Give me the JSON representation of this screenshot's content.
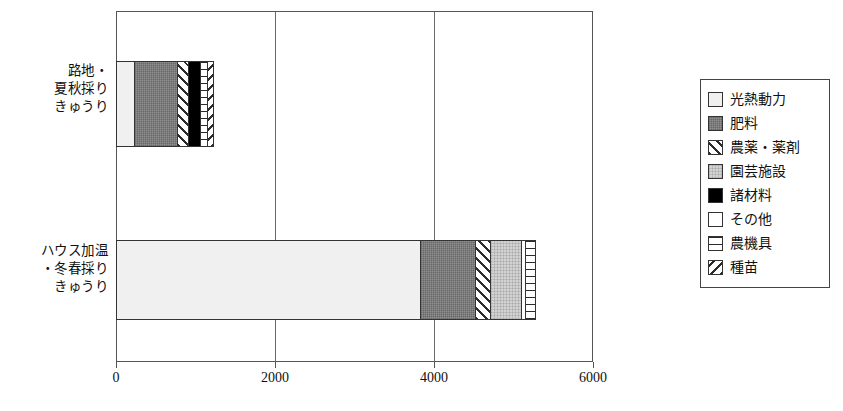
{
  "chart_data": {
    "type": "bar",
    "orientation": "horizontal",
    "stacked": true,
    "title": "",
    "xlabel": "",
    "ylabel": "",
    "xlim": [
      0,
      6000
    ],
    "xticks": [
      "0",
      "2000",
      "4000",
      "6000"
    ],
    "grid": true,
    "legend_position": "right",
    "categories": [
      "路地・\n夏秋採り\nきゅうり",
      "ハウス加温\n・冬春採り\nきゅうり"
    ],
    "series": [
      {
        "name": "光熱動力",
        "values": [
          225,
          3830
        ]
      },
      {
        "name": "肥料",
        "values": [
          540,
          690
        ]
      },
      {
        "name": "農薬・薬剤",
        "values": [
          140,
          190
        ]
      },
      {
        "name": "園芸施設",
        "values": [
          0,
          380
        ]
      },
      {
        "name": "諸材料",
        "values": [
          150,
          0
        ]
      },
      {
        "name": "その他",
        "values": [
          0,
          60
        ]
      },
      {
        "name": "農機具",
        "values": [
          90,
          115
        ]
      },
      {
        "name": "種苗",
        "values": [
          75,
          0
        ]
      }
    ],
    "totals": [
      1220,
      5265
    ]
  },
  "legend": {
    "items": [
      {
        "label": "光熱動力",
        "pattern": "p-konetsu"
      },
      {
        "label": "肥料",
        "pattern": "p-hiryo"
      },
      {
        "label": "農薬・薬剤",
        "pattern": "p-nouyaku"
      },
      {
        "label": "園芸施設",
        "pattern": "p-engei"
      },
      {
        "label": "諸材料",
        "pattern": "p-shozairyo"
      },
      {
        "label": "その他",
        "pattern": "p-sonota"
      },
      {
        "label": "農機具",
        "pattern": "p-noukigu"
      },
      {
        "label": "種苗",
        "pattern": "p-shubyo"
      }
    ]
  },
  "axis": {
    "ticks": [
      {
        "label": "0",
        "value": 0
      },
      {
        "label": "2000",
        "value": 2000
      },
      {
        "label": "4000",
        "value": 4000
      },
      {
        "label": "6000",
        "value": 6000
      }
    ]
  },
  "colors": {
    "frame": "#555555",
    "gridline": "#6a6a6a",
    "text": "#111111"
  }
}
